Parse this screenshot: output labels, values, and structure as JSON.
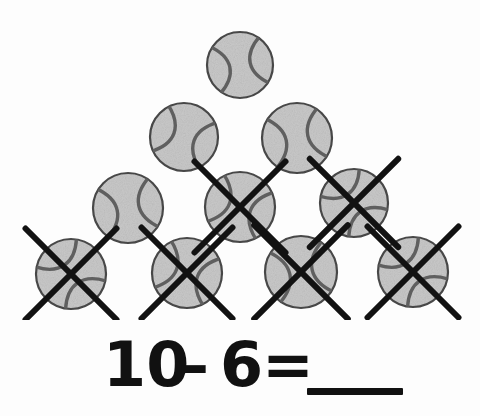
{
  "page": {
    "kind": "math-worksheet-subtraction-problem",
    "background_color": "#fdfdfd"
  },
  "illustration": {
    "object_name": "tennis-ball",
    "arrangement": "triangle-pyramid",
    "total_count": 10,
    "crossed_out_count": 6,
    "remaining_count": 4,
    "ball_fill_color": "#c9c9c9",
    "ball_outline_color": "#4a4a4a",
    "seam_color": "#5f5f5f",
    "cross_mark_color": "#121212",
    "rows": [
      {
        "row_index": 1,
        "count": 1,
        "balls": [
          {
            "id": "ball-1",
            "cx": 240,
            "cy": 65,
            "r": 33,
            "crossed_out": false,
            "seam_style": "a"
          }
        ]
      },
      {
        "row_index": 2,
        "count": 2,
        "balls": [
          {
            "id": "ball-2",
            "cx": 184,
            "cy": 137,
            "r": 34,
            "crossed_out": false,
            "seam_style": "b"
          },
          {
            "id": "ball-3",
            "cx": 297,
            "cy": 138,
            "r": 35,
            "crossed_out": false,
            "seam_style": "a"
          }
        ]
      },
      {
        "row_index": 3,
        "count": 3,
        "balls": [
          {
            "id": "ball-4",
            "cx": 128,
            "cy": 208,
            "r": 35,
            "crossed_out": false,
            "seam_style": "a"
          },
          {
            "id": "ball-5",
            "cx": 240,
            "cy": 207,
            "r": 35,
            "crossed_out": true,
            "seam_style": "b"
          },
          {
            "id": "ball-6",
            "cx": 354,
            "cy": 203,
            "r": 34,
            "crossed_out": true,
            "seam_style": "c"
          }
        ]
      },
      {
        "row_index": 4,
        "count": 4,
        "balls": [
          {
            "id": "ball-7",
            "cx": 71,
            "cy": 274,
            "r": 35,
            "crossed_out": true,
            "seam_style": "c"
          },
          {
            "id": "ball-8",
            "cx": 187,
            "cy": 273,
            "r": 35,
            "crossed_out": true,
            "seam_style": "b"
          },
          {
            "id": "ball-9",
            "cx": 301,
            "cy": 272,
            "r": 36,
            "crossed_out": true,
            "seam_style": "a"
          },
          {
            "id": "ball-10",
            "cx": 413,
            "cy": 272,
            "r": 35,
            "crossed_out": true,
            "seam_style": "c"
          }
        ]
      }
    ]
  },
  "equation": {
    "full_text": "10 - 6 = ___",
    "minuend": "10",
    "operator": "–",
    "subtrahend": "6",
    "equals": "=",
    "answer_blank": "",
    "answer_blank_label": "answer-blank"
  },
  "chart_data": {
    "type": "bar",
    "title": "10 – 6 = ___",
    "categories": [
      "Total balls",
      "Crossed out",
      "Remaining"
    ],
    "values": [
      10,
      6,
      4
    ],
    "xlabel": "",
    "ylabel": "Count",
    "ylim": [
      0,
      10
    ]
  }
}
